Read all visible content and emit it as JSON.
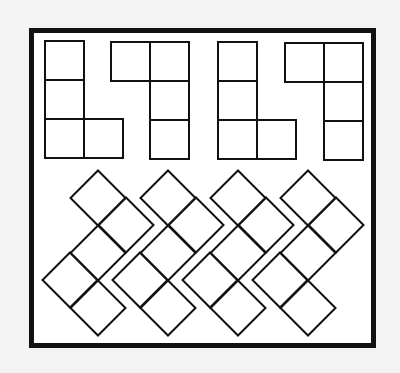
{
  "diagram": {
    "type": "mental-rotation-puzzle",
    "background_color": "#f3f3f3",
    "frame": {
      "x": 31.5,
      "y": 30.5,
      "width": 342,
      "height": 315,
      "stroke": "#111111",
      "stroke_width": 5,
      "fill": "#ffffff"
    },
    "line_color": "#111111",
    "line_width": 2,
    "top_row": {
      "description": "four upright square-grid polyominoes (tetrominoes)",
      "cell_size": 39,
      "shapes": [
        {
          "id": "shape-1",
          "origin": [
            45,
            41
          ],
          "cells": [
            [
              0,
              0
            ],
            [
              0,
              1
            ],
            [
              0,
              2
            ],
            [
              1,
              2
            ]
          ]
        },
        {
          "id": "shape-2",
          "origin": [
            111,
            42
          ],
          "cells": [
            [
              0,
              0
            ],
            [
              1,
              0
            ],
            [
              1,
              1
            ],
            [
              1,
              2
            ]
          ]
        },
        {
          "id": "shape-3",
          "origin": [
            218,
            42
          ],
          "cells": [
            [
              0,
              0
            ],
            [
              0,
              1
            ],
            [
              0,
              2
            ],
            [
              1,
              2
            ]
          ]
        },
        {
          "id": "shape-4",
          "origin": [
            285,
            43
          ],
          "cells": [
            [
              0,
              0
            ],
            [
              1,
              0
            ],
            [
              1,
              1
            ],
            [
              1,
              2
            ]
          ]
        }
      ]
    },
    "bottom_row": {
      "description": "four rotated (45°) pentomino figures",
      "half_diagonal": 27.5,
      "shapes": [
        {
          "id": "shape-5",
          "centers": [
            [
              98,
              198
            ],
            [
              126,
              225
            ],
            [
              98,
              253
            ],
            [
              70,
              280
            ],
            [
              98,
              308
            ]
          ]
        },
        {
          "id": "shape-6",
          "centers": [
            [
              168,
              198
            ],
            [
              196,
              225
            ],
            [
              168,
              253
            ],
            [
              140,
              280
            ],
            [
              168,
              308
            ]
          ]
        },
        {
          "id": "shape-7",
          "centers": [
            [
              238,
              198
            ],
            [
              266,
              225
            ],
            [
              238,
              253
            ],
            [
              210,
              280
            ],
            [
              238,
              308
            ]
          ]
        },
        {
          "id": "shape-8",
          "centers": [
            [
              308,
              198
            ],
            [
              336,
              225
            ],
            [
              308,
              253
            ],
            [
              280,
              280
            ],
            [
              308,
              308
            ]
          ]
        }
      ]
    }
  }
}
